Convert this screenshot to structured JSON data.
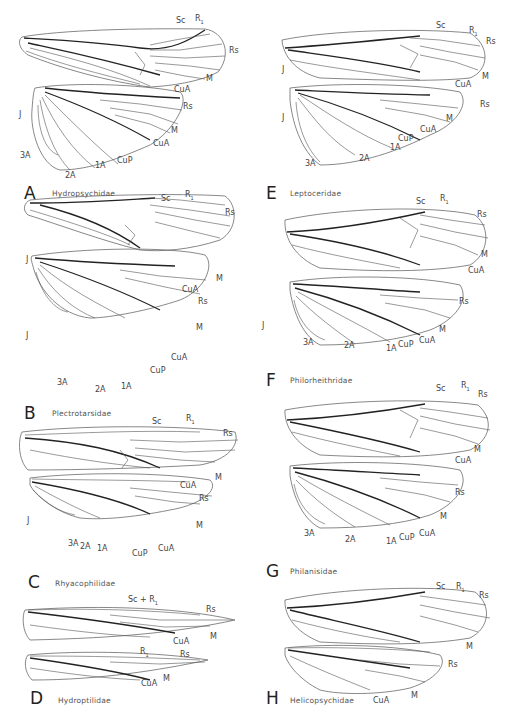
{
  "figure": {
    "panels": [
      {
        "letter": "A",
        "family": "Hydropsychidae",
        "forewing_labels": [
          "Sc",
          "R1",
          "Rs",
          "M",
          "CuA"
        ],
        "hindwing_labels": [
          "J",
          "Rs",
          "M",
          "CuA",
          "CuP",
          "1A",
          "2A",
          "3A"
        ]
      },
      {
        "letter": "B",
        "family": "Plectrotarsidae",
        "forewing_labels": [
          "Sc",
          "R1",
          "Rs",
          "J",
          "M",
          "CuA"
        ],
        "hindwing_labels": [
          "J",
          "Rs",
          "M",
          "CuA",
          "CuP",
          "1A",
          "2A",
          "3A"
        ]
      },
      {
        "letter": "C",
        "family": "Rhyacophilidae",
        "forewing_labels": [
          "Sc",
          "R1",
          "Rs",
          "M",
          "CuA"
        ],
        "hindwing_labels": [
          "J",
          "Rs",
          "M",
          "CuA",
          "CuP",
          "1A",
          "2A",
          "3A"
        ]
      },
      {
        "letter": "D",
        "family": "Hydroptilidae",
        "forewing_labels": [
          "Sc + R1",
          "Rs",
          "M",
          "CuA"
        ],
        "hindwing_labels": [
          "R1",
          "Rs",
          "M",
          "CuA"
        ]
      },
      {
        "letter": "E",
        "family": "Leptoceridae",
        "forewing_labels": [
          "Sc",
          "R1",
          "Rs",
          "J",
          "M",
          "CuA"
        ],
        "hindwing_labels": [
          "J",
          "Rs",
          "M",
          "CuA",
          "CuP",
          "1A",
          "2A",
          "3A"
        ]
      },
      {
        "letter": "F",
        "family": "Philorheithridae",
        "forewing_labels": [
          "Sc",
          "R1",
          "Rs",
          "M",
          "CuA"
        ],
        "hindwing_labels": [
          "J",
          "Rs",
          "M",
          "CuA",
          "CuP",
          "1A",
          "2A",
          "3A"
        ]
      },
      {
        "letter": "G",
        "family": "Philanisidae",
        "forewing_labels": [
          "Sc",
          "R1",
          "Rs",
          "M",
          "CuA"
        ],
        "hindwing_labels": [
          "Rs",
          "M",
          "CuA",
          "CuP",
          "1A",
          "2A",
          "3A"
        ]
      },
      {
        "letter": "H",
        "family": "Helicopsychidae",
        "forewing_labels": [
          "Sc",
          "R1",
          "Rs",
          "M"
        ],
        "hindwing_labels": [
          "Rs",
          "M",
          "CuA"
        ]
      }
    ]
  },
  "labels": {
    "Sc": "Sc",
    "R1": "R",
    "R1_sub": "1",
    "Rs": "Rs",
    "M": "M",
    "CuA": "CuA",
    "CuP": "CuP",
    "A1": "1A",
    "A2": "2A",
    "A3": "3A",
    "J": "J",
    "ScR1": "Sc + R",
    "ScR1_sub": "1"
  }
}
